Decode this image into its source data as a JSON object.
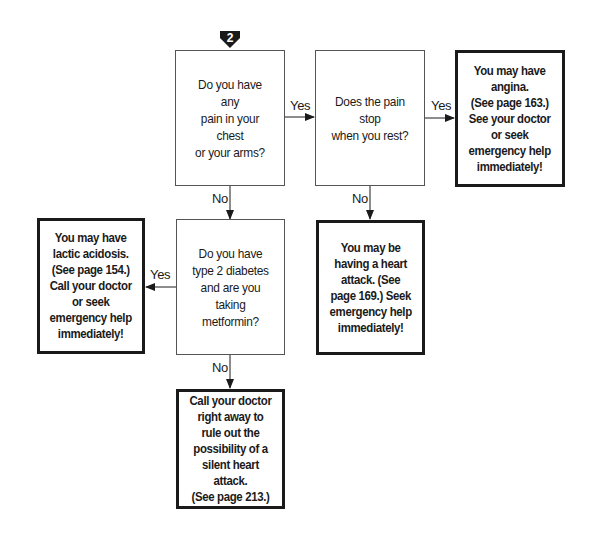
{
  "step_marker": {
    "number": "2",
    "icon": "down-arrow-badge-icon"
  },
  "questions": [
    {
      "id": "chest-pain",
      "text": "Do you have any\npain in your chest\nor your arms?"
    },
    {
      "id": "pain-stop",
      "text": "Does the pain stop\nwhen you rest?"
    },
    {
      "id": "diabetes",
      "text": "Do you have\ntype 2 diabetes\nand are you\ntaking metformin?"
    }
  ],
  "results": [
    {
      "id": "angina",
      "text": "You may have\nangina.\n(See page 163.)\nSee your doctor\nor seek\nemergency help\nimmediately!"
    },
    {
      "id": "heart-attack",
      "text": "You may be\nhaving a heart\nattack. (See\npage 169.) Seek\nemergency help\nimmediately!"
    },
    {
      "id": "lactic-acidosis",
      "text": "You may have\nlactic acidosis.\n(See page 154.)\nCall your doctor\nor seek\nemergency help\nimmediately!"
    },
    {
      "id": "silent-heart-attack",
      "text": "Call your doctor\nright away to\nrule out the\npossibility of a\nsilent heart attack.\n(See page 213.)"
    }
  ],
  "edges": {
    "chest_to_stop": "Yes",
    "stop_to_angina": "Yes",
    "chest_to_diabetes": "No",
    "stop_to_heart_attack": "No",
    "diabetes_to_lactic": "Yes",
    "diabetes_to_silent": "No"
  }
}
